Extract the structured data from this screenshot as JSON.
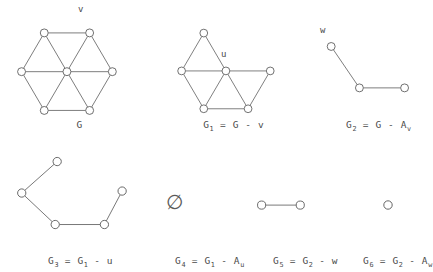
{
  "figure": {
    "background": "#ffffff",
    "ink": "#4a4a4a",
    "node_fill": "#ffffff",
    "node_stroke": "#555555",
    "edge_stroke": "#666666"
  },
  "panels": [
    {
      "id": "G",
      "caption_main": "G",
      "caption_sub": "",
      "caption_rest": "",
      "vertex_labels": [
        {
          "name": "v",
          "text": "v"
        }
      ]
    },
    {
      "id": "G1",
      "caption_main": "G",
      "caption_sub": "1",
      "caption_rest": " = G - v",
      "vertex_labels": [
        {
          "name": "u",
          "text": "u"
        }
      ]
    },
    {
      "id": "G2",
      "caption_main": "G",
      "caption_sub": "2",
      "caption_rest": " = G - A",
      "caption_rest_sub": "v",
      "vertex_labels": [
        {
          "name": "w",
          "text": "w"
        }
      ]
    },
    {
      "id": "G3",
      "caption_main": "G",
      "caption_sub": "3",
      "caption_rest": " = G",
      "caption_rest_sub": "1",
      "caption_tail": " - u",
      "vertex_labels": []
    },
    {
      "id": "G4",
      "caption_main": "G",
      "caption_sub": "4",
      "caption_rest": " = G",
      "caption_rest_sub": "1",
      "caption_tail": " - A",
      "caption_tail_sub": "u",
      "symbol": "∅",
      "vertex_labels": []
    },
    {
      "id": "G5",
      "caption_main": "G",
      "caption_sub": "5",
      "caption_rest": " = G",
      "caption_rest_sub": "2",
      "caption_tail": " - w",
      "vertex_labels": []
    },
    {
      "id": "G6",
      "caption_main": "G",
      "caption_sub": "6",
      "caption_rest": " = G",
      "caption_rest_sub": "2",
      "caption_tail": " - A",
      "caption_tail_sub": "w",
      "vertex_labels": []
    }
  ],
  "graphs": {
    "G": {
      "type": "wheel",
      "node_radius": 4.2,
      "nodes": [
        {
          "id": "n-tl",
          "x": 26,
          "y": 14
        },
        {
          "id": "n-tr",
          "x": 74,
          "y": 14
        },
        {
          "id": "n-r",
          "x": 98,
          "y": 55
        },
        {
          "id": "n-br",
          "x": 74,
          "y": 96
        },
        {
          "id": "n-bl",
          "x": 26,
          "y": 96
        },
        {
          "id": "n-l",
          "x": 2,
          "y": 55
        },
        {
          "id": "n-c",
          "x": 50,
          "y": 55
        }
      ],
      "edges": [
        [
          "n-tl",
          "n-tr"
        ],
        [
          "n-tr",
          "n-r"
        ],
        [
          "n-r",
          "n-br"
        ],
        [
          "n-br",
          "n-bl"
        ],
        [
          "n-bl",
          "n-l"
        ],
        [
          "n-l",
          "n-tl"
        ],
        [
          "n-c",
          "n-tl"
        ],
        [
          "n-c",
          "n-tr"
        ],
        [
          "n-c",
          "n-r"
        ],
        [
          "n-c",
          "n-br"
        ],
        [
          "n-c",
          "n-bl"
        ],
        [
          "n-c",
          "n-l"
        ]
      ]
    },
    "G1": {
      "type": "wheel-minus-vertex",
      "node_radius": 4.2,
      "nodes": [
        {
          "id": "n-tl",
          "x": 26,
          "y": 14
        },
        {
          "id": "n-r",
          "x": 98,
          "y": 55
        },
        {
          "id": "n-br",
          "x": 74,
          "y": 96
        },
        {
          "id": "n-bl",
          "x": 26,
          "y": 96
        },
        {
          "id": "n-l",
          "x": 2,
          "y": 55
        },
        {
          "id": "n-c",
          "x": 50,
          "y": 55
        }
      ],
      "edges": [
        [
          "n-r",
          "n-br"
        ],
        [
          "n-br",
          "n-bl"
        ],
        [
          "n-bl",
          "n-l"
        ],
        [
          "n-l",
          "n-tl"
        ],
        [
          "n-c",
          "n-tl"
        ],
        [
          "n-c",
          "n-r"
        ],
        [
          "n-c",
          "n-br"
        ],
        [
          "n-c",
          "n-bl"
        ],
        [
          "n-c",
          "n-l"
        ]
      ]
    },
    "G2": {
      "type": "path3",
      "node_radius": 4.2,
      "nodes": [
        {
          "id": "p1",
          "x": 8,
          "y": 10
        },
        {
          "id": "p2",
          "x": 38,
          "y": 54
        },
        {
          "id": "p3",
          "x": 86,
          "y": 54
        }
      ],
      "edges": [
        [
          "p1",
          "p2"
        ],
        [
          "p2",
          "p3"
        ]
      ]
    },
    "G3": {
      "type": "path5",
      "node_radius": 4.2,
      "nodes": [
        {
          "id": "q1",
          "x": 46,
          "y": 6
        },
        {
          "id": "q2",
          "x": 10,
          "y": 38
        },
        {
          "id": "q3",
          "x": 44,
          "y": 70
        },
        {
          "id": "q4",
          "x": 94,
          "y": 70
        },
        {
          "id": "q5",
          "x": 112,
          "y": 36
        }
      ],
      "edges": [
        [
          "q1",
          "q2"
        ],
        [
          "q2",
          "q3"
        ],
        [
          "q3",
          "q4"
        ],
        [
          "q4",
          "q5"
        ]
      ]
    },
    "G5": {
      "type": "path2",
      "node_radius": 4.2,
      "nodes": [
        {
          "id": "r1",
          "x": 6,
          "y": 8
        },
        {
          "id": "r2",
          "x": 46,
          "y": 8
        }
      ],
      "edges": [
        [
          "r1",
          "r2"
        ]
      ]
    },
    "G6": {
      "type": "single",
      "node_radius": 4.2,
      "nodes": [
        {
          "id": "s1",
          "x": 6,
          "y": 8
        }
      ],
      "edges": []
    }
  }
}
